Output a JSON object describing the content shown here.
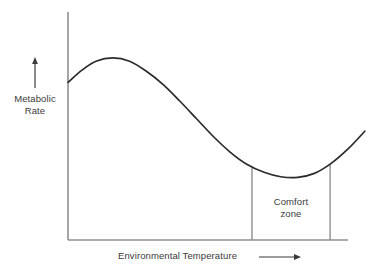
{
  "figure": {
    "background_color": "#ffffff",
    "line_color": "#2b2b2b",
    "axis_color": "#8a8a8a",
    "text_color": "#3a3a3a",
    "width": 378,
    "height": 269
  },
  "labels": {
    "y_axis_line1": "Metabolic",
    "y_axis_line2": "Rate",
    "x_axis": "Environmental Temperature",
    "comfort_line1": "Comfort",
    "comfort_line2": "zone",
    "y_arrow_icon": "arrow-up-icon",
    "x_arrow_icon": "arrow-right-icon"
  },
  "chart_data": {
    "type": "line",
    "title": "",
    "subtitle": "",
    "xlabel": "Environmental Temperature",
    "ylabel": "Metabolic Rate",
    "grid": false,
    "legend": null,
    "axis_ticks": {
      "x": [],
      "y": []
    },
    "axis_direction_arrows": {
      "x": "increasing to the right",
      "y": "increasing upward"
    },
    "xlim": [
      0,
      100
    ],
    "ylim": [
      0,
      100
    ],
    "series": [
      {
        "name": "Metabolic Rate",
        "comment": "Schematic curve: elevated at cold temperatures, peaks just above the cold end, falls steadily through the thermoneutral range to a minimum inside the comfort zone, then rises again at high temperatures.",
        "points": [
          {
            "x": 0.0,
            "y": 71.0
          },
          {
            "x": 5.0,
            "y": 76.5
          },
          {
            "x": 10.0,
            "y": 80.5
          },
          {
            "x": 16.0,
            "y": 82.0
          },
          {
            "x": 22.0,
            "y": 80.5
          },
          {
            "x": 28.0,
            "y": 76.0
          },
          {
            "x": 34.0,
            "y": 70.0
          },
          {
            "x": 40.0,
            "y": 62.5
          },
          {
            "x": 46.0,
            "y": 54.5
          },
          {
            "x": 52.0,
            "y": 46.5
          },
          {
            "x": 58.0,
            "y": 39.5
          },
          {
            "x": 64.0,
            "y": 34.0
          },
          {
            "x": 70.0,
            "y": 30.5
          },
          {
            "x": 76.0,
            "y": 28.5
          },
          {
            "x": 82.0,
            "y": 28.2
          },
          {
            "x": 88.0,
            "y": 30.0
          },
          {
            "x": 94.0,
            "y": 34.5
          },
          {
            "x": 100.0,
            "y": 41.0
          },
          {
            "x": 106.0,
            "y": 49.0
          }
        ]
      }
    ],
    "annotations": [
      {
        "name": "comfort-zone",
        "label": "Comfort zone",
        "type": "vertical-band-boundaries",
        "x_start": 65.7,
        "x_end": 93.6,
        "note": "Two vertical drop lines from the curve down to the x-axis delimit the comfort (thermoneutral) zone; the metabolic minimum lies within it."
      }
    ],
    "markers": {
      "peak": {
        "x": 16.0,
        "y": 82.0,
        "label": "maximum metabolic rate (cold)"
      },
      "trough": {
        "x": 82.0,
        "y": 28.2,
        "label": "minimum metabolic rate (comfort zone)"
      }
    }
  }
}
